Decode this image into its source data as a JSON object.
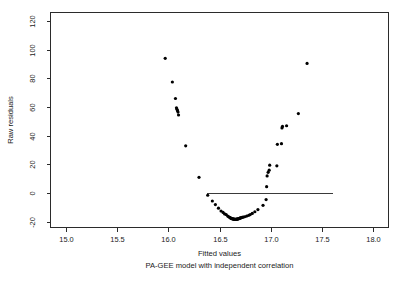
{
  "chart_data": {
    "type": "scatter",
    "title": "",
    "xlabel": "Fitted values",
    "sublabel": "PA-GEE model with independent correlation",
    "ylabel": "Raw residuals",
    "xlim": [
      14.85,
      18.15
    ],
    "ylim": [
      -24,
      126
    ],
    "xticks": [
      15.0,
      15.5,
      16.0,
      16.5,
      17.0,
      17.5,
      18.0
    ],
    "xtick_labels": [
      "15.0",
      "15.5",
      "16.0",
      "16.5",
      "17.0",
      "17.5",
      "18.0"
    ],
    "yticks": [
      -20,
      0,
      20,
      40,
      60,
      80,
      100,
      120
    ],
    "ytick_labels": [
      "-20",
      "0",
      "20",
      "40",
      "60",
      "80",
      "100",
      "120"
    ],
    "grid": false,
    "legend": false,
    "point_color": "#000000",
    "point_size": 1.6,
    "reference_line": {
      "y": 0,
      "x_start": 16.38,
      "x_end": 17.61,
      "color": "#3a3a3a"
    },
    "x": [
      15.97,
      16.04,
      16.07,
      16.08,
      16.085,
      16.09,
      16.095,
      16.1,
      16.17,
      16.3,
      16.385,
      16.43,
      16.46,
      16.49,
      16.515,
      16.535,
      16.55,
      16.565,
      16.58,
      16.59,
      16.6,
      16.605,
      16.61,
      16.615,
      16.62,
      16.625,
      16.63,
      16.635,
      16.64,
      16.645,
      16.65,
      16.655,
      16.66,
      16.665,
      16.67,
      16.675,
      16.68,
      16.685,
      16.69,
      16.695,
      16.7,
      16.705,
      16.71,
      16.72,
      16.73,
      16.745,
      16.765,
      16.785,
      16.8,
      16.82,
      16.845,
      16.875,
      16.925,
      16.955,
      16.96,
      16.965,
      16.975,
      16.985,
      16.99,
      17.06,
      17.065,
      17.105,
      17.11,
      17.115,
      17.155,
      17.27,
      17.355
    ],
    "y": [
      94,
      77.5,
      66,
      59.5,
      58.5,
      57.5,
      56.5,
      54.5,
      33,
      11,
      -1.5,
      -5.5,
      -8,
      -10.5,
      -12.5,
      -13.5,
      -14.5,
      -15,
      -16,
      -16.5,
      -17,
      -17.2,
      -17.5,
      -17.6,
      -17.8,
      -17.9,
      -18,
      -18.1,
      -18.2,
      -18.2,
      -18.3,
      -18.3,
      -18.3,
      -18.2,
      -18.2,
      -18.1,
      -18,
      -17.9,
      -17.8,
      -17.6,
      -17.5,
      -17.3,
      -17.2,
      -17,
      -16.8,
      -16.5,
      -16,
      -15.5,
      -15,
      -14.2,
      -13,
      -11.5,
      -8.5,
      -4.5,
      4.5,
      12,
      14.5,
      16,
      19.5,
      19,
      34,
      34.5,
      45.5,
      46.5,
      47,
      55.5,
      90.5,
      118
    ],
    "n_points": 67
  },
  "figure": {
    "background": "#ffffff",
    "frame_color": "#2b2b2b"
  }
}
